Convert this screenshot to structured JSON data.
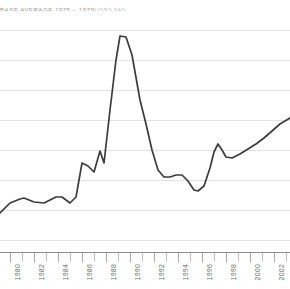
{
  "header": {
    "caption": "BASE AVERAGE 1975 – 1979",
    "value": "US$3,040"
  },
  "colors": {
    "line": "#3c3c3c",
    "gridline": "#e2e2e2",
    "axis": "#8d8d8d",
    "tick": "#bdbdbd",
    "label": "#6d6d6d",
    "caption": "#9a9a9a",
    "value": "#c3c3c3",
    "background": "#ffffff"
  },
  "axis": {
    "tick_labels": [
      "1980",
      "1982",
      "1984",
      "1986",
      "1988",
      "1990",
      "1992",
      "1994",
      "1996",
      "1998",
      "2000",
      "2002"
    ],
    "tick_count": 24,
    "tick_start_x": 10,
    "tick_spacing": 12,
    "label_spacing": 24
  },
  "grid": {
    "y_positions": [
      30,
      60,
      90,
      120,
      150,
      180,
      210,
      240
    ],
    "visible": true
  },
  "chart_data": {
    "type": "line",
    "xlabel": "",
    "ylabel": "",
    "grid": true,
    "legend": null,
    "xlim": [
      1979,
      2003
    ],
    "ylim": [
      0,
      8.4
    ],
    "note": "Index of annual value; y values are relative index units read off the 8 evenly spaced gridlines (gridline spacing = 1.0 unit, bottom gridline at y=0.4, top gridline at 7.4).",
    "x": [
      1979,
      1980,
      1981,
      1982,
      1983,
      1984,
      1985,
      1986,
      1987,
      1988,
      1989,
      1990,
      1991,
      1992,
      1993,
      1994,
      1995,
      1996,
      1997,
      1998,
      1999,
      2000,
      2001,
      2002,
      2003
    ],
    "values": [
      1.3,
      1.9,
      2.1,
      1.9,
      2.1,
      2.2,
      2.0,
      3.3,
      2.9,
      4.6,
      7.2,
      6.4,
      4.5,
      2.9,
      3.0,
      2.9,
      2.4,
      3.6,
      3.0,
      3.2,
      3.5,
      3.7,
      4.0,
      4.2,
      4.6
    ],
    "peak": {
      "x": 1989,
      "y": 7.2
    },
    "series": [
      {
        "name": "Annual value index",
        "color": "#3c3c3c",
        "points": [
          [
            0,
            213
          ],
          [
            10,
            203
          ],
          [
            20,
            199
          ],
          [
            24,
            198
          ],
          [
            34,
            202
          ],
          [
            44,
            203
          ],
          [
            50,
            200
          ],
          [
            56,
            197
          ],
          [
            62,
            197
          ],
          [
            70,
            203
          ],
          [
            76,
            197
          ],
          [
            82,
            163
          ],
          [
            88,
            166
          ],
          [
            94,
            172
          ],
          [
            100,
            151
          ],
          [
            104,
            163
          ],
          [
            110,
            110
          ],
          [
            116,
            60
          ],
          [
            120,
            36
          ],
          [
            126,
            37
          ],
          [
            132,
            55
          ],
          [
            140,
            100
          ],
          [
            146,
            124
          ],
          [
            152,
            150
          ],
          [
            158,
            170
          ],
          [
            164,
            177
          ],
          [
            170,
            177
          ],
          [
            176,
            175
          ],
          [
            182,
            175
          ],
          [
            188,
            181
          ],
          [
            194,
            190
          ],
          [
            198,
            191
          ],
          [
            204,
            186
          ],
          [
            210,
            168
          ],
          [
            214,
            152
          ],
          [
            218,
            144
          ],
          [
            222,
            150
          ],
          [
            226,
            157
          ],
          [
            232,
            158
          ],
          [
            240,
            154
          ],
          [
            248,
            149
          ],
          [
            256,
            144
          ],
          [
            264,
            138
          ],
          [
            272,
            131
          ],
          [
            280,
            124
          ],
          [
            290,
            118
          ]
        ]
      }
    ]
  }
}
